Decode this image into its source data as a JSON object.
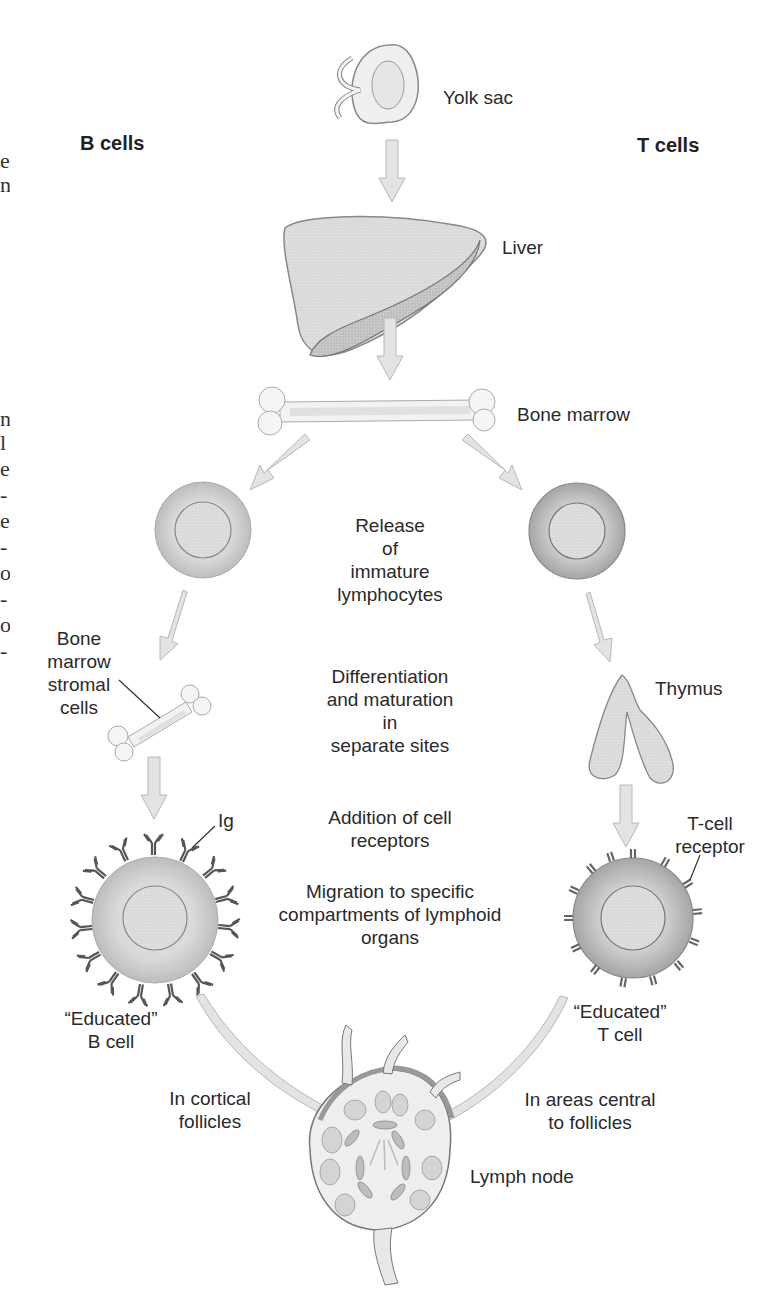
{
  "diagram": {
    "title_left": "B cells",
    "title_right": "T cells",
    "organs": {
      "yolk_sac": "Yolk sac",
      "liver": "Liver",
      "bone_marrow": "Bone marrow",
      "thymus": "Thymus",
      "lymph_node": "Lymph node"
    },
    "labels": {
      "bm_stromal": "Bone\nmarrow\nstromal\ncells",
      "ig": "Ig",
      "tcr": "T-cell\nreceptor",
      "educated_b": "“Educated”\nB cell",
      "educated_t": "“Educated”\nT cell",
      "cortical": "In cortical\nfollicles",
      "central": "In areas central\nto follicles"
    },
    "steps": {
      "release": "Release\nof\nimmature\nlymphocytes",
      "differentiation": "Differentiation\nand maturation\nin\nseparate sites",
      "addition": "Addition of cell\nreceptors",
      "migration": "Migration to specific\ncompartments of lymphoid\norgans"
    },
    "margin_fragments": [
      "e",
      "n",
      "n",
      "l",
      "e",
      "-",
      "e",
      "-",
      "o",
      "-",
      "o",
      "-"
    ],
    "colors": {
      "fill_light": "#e6e6e6",
      "fill_mid": "#cfcfcf",
      "outline": "#777777",
      "receptor": "#555555",
      "text": "#2a2a2a"
    }
  }
}
